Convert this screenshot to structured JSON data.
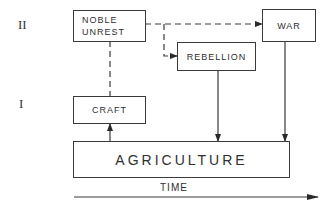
{
  "diagram": {
    "levels": [
      {
        "id": "level-2",
        "label": "II"
      },
      {
        "id": "level-1",
        "label": "I"
      }
    ],
    "nodes": {
      "noble_unrest": {
        "label_line1": "NOBLE",
        "label_line2": "UNREST",
        "level": "II"
      },
      "war": {
        "label": "WAR",
        "level": "II"
      },
      "rebellion": {
        "label": "REBELLION",
        "level": "II"
      },
      "craft": {
        "label": "CRAFT",
        "level": "I"
      },
      "agriculture": {
        "label": "AGRICULTURE",
        "level": "base"
      }
    },
    "edges": [
      {
        "from": "noble_unrest",
        "to": "war",
        "style": "dashed",
        "arrow": true
      },
      {
        "from": "noble_unrest",
        "to": "rebellion",
        "style": "dashed",
        "arrow": true
      },
      {
        "from": "noble_unrest",
        "to": "craft",
        "style": "dashed",
        "arrow": false
      },
      {
        "from": "agriculture",
        "to": "craft",
        "style": "solid",
        "arrow": true
      },
      {
        "from": "rebellion",
        "to": "agriculture",
        "style": "solid",
        "arrow": true
      },
      {
        "from": "war",
        "to": "agriculture",
        "style": "solid",
        "arrow": true
      }
    ],
    "time_axis": {
      "label": "TIME",
      "direction": "right"
    },
    "colors": {
      "line": "#3a3a3a",
      "background": "#ffffff"
    }
  }
}
